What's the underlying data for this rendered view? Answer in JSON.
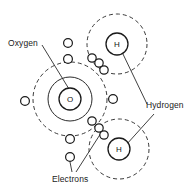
{
  "diagram": {
    "type": "atomic-bonding-diagram",
    "background_color": "#ffffff",
    "line_color": "#2b2b2b",
    "labels": {
      "oxygen": "Oxygen",
      "hydrogen": "Hydrogen",
      "electrons": "Electrons"
    },
    "atoms": {
      "oxygen": {
        "symbol": "O",
        "nucleus": {
          "cx": 70,
          "cy": 99,
          "r": 11
        },
        "shells": [
          {
            "name": "inner-shell",
            "cx": 70,
            "cy": 99,
            "r": 22,
            "style": "solid"
          },
          {
            "name": "outer-shell",
            "cx": 70,
            "cy": 99,
            "r": 37,
            "style": "dashed"
          }
        ]
      },
      "hydrogen_top": {
        "symbol": "H",
        "nucleus": {
          "cx": 117,
          "cy": 44,
          "r": 11
        },
        "shells": [
          {
            "name": "shell",
            "cx": 117,
            "cy": 44,
            "r": 30,
            "style": "dashed"
          }
        ]
      },
      "hydrogen_bottom": {
        "symbol": "H",
        "nucleus": {
          "cx": 119,
          "cy": 149,
          "r": 11
        },
        "shells": [
          {
            "name": "shell",
            "cx": 119,
            "cy": 149,
            "r": 30,
            "style": "dashed"
          }
        ]
      }
    },
    "electrons": [
      {
        "cx": 68,
        "cy": 43,
        "r": 4.4,
        "shell": "oxygen-outer"
      },
      {
        "cx": 68,
        "cy": 59,
        "r": 4.4,
        "shell": "oxygen-inner"
      },
      {
        "cx": 25,
        "cy": 101,
        "r": 4.4,
        "shell": "oxygen-outer"
      },
      {
        "cx": 113,
        "cy": 99,
        "r": 4.4,
        "shell": "oxygen-outer"
      },
      {
        "cx": 70,
        "cy": 139,
        "r": 4.4,
        "shell": "oxygen-inner"
      },
      {
        "cx": 70,
        "cy": 157,
        "r": 4.4,
        "shell": "oxygen-outer"
      },
      {
        "cx": 92,
        "cy": 58,
        "r": 4.2,
        "shell": "bond-top"
      },
      {
        "cx": 99,
        "cy": 63,
        "r": 4.2,
        "shell": "bond-top"
      },
      {
        "cx": 104,
        "cy": 70,
        "r": 4.2,
        "shell": "bond-top"
      },
      {
        "cx": 92,
        "cy": 121,
        "r": 4.2,
        "shell": "bond-bottom"
      },
      {
        "cx": 99,
        "cy": 128,
        "r": 4.2,
        "shell": "bond-bottom"
      },
      {
        "cx": 104,
        "cy": 135,
        "r": 4.2,
        "shell": "bond-bottom"
      }
    ],
    "leaders": [
      {
        "name": "oxygen-leader",
        "x1": 42,
        "y1": 45,
        "x2": 69,
        "y2": 89
      },
      {
        "name": "hydrogen-top-leader",
        "x1": 147,
        "y1": 104,
        "x2": 122,
        "y2": 52
      },
      {
        "name": "hydrogen-bottom-leader",
        "x1": 154,
        "y1": 114,
        "x2": 126,
        "y2": 145
      },
      {
        "name": "electrons-leader-left",
        "x1": 72,
        "y1": 174,
        "x2": 70,
        "y2": 162
      },
      {
        "name": "electrons-leader-right",
        "x1": 75,
        "y1": 174,
        "x2": 101,
        "y2": 133
      }
    ]
  }
}
